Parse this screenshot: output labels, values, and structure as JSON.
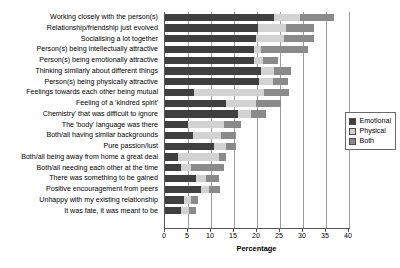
{
  "chart_data": {
    "type": "bar",
    "orientation": "horizontal",
    "stacked": true,
    "title": "",
    "xlabel": "Percentage",
    "ylabel": "",
    "xlim": [
      0,
      40
    ],
    "xticks": [
      0,
      5,
      10,
      15,
      20,
      25,
      30,
      35,
      40
    ],
    "grid": true,
    "legend_position": "right",
    "legend": [
      "Emotional",
      "Physical",
      "Both"
    ],
    "colors": {
      "Emotional": "#3f3f3f",
      "Physical": "#d2d2d2",
      "Both": "#8a8a8a"
    },
    "categories": [
      "Working closely with the person(s)",
      "Relationship/friendship just evolved",
      "Socialising a lot together",
      "Person(s) being intellectually attractive",
      "Person(s) being emotionally attractive",
      "Thinking similarly about different things",
      "Person(s) being physically attractive",
      "Feelings towards each other being mutual",
      "Feeling of a 'kindred spirit'",
      "Chemistry' that was difficult to ignore",
      "The 'body' language was there",
      "Both/all having similar backgrounds",
      "Pure passion/lust",
      "Both/all being away from home a great deal",
      "Both/all needing each other at the time",
      "There was something to be gained",
      "Positive encouragement from peers",
      "Unhappy with my existing relationship",
      "It was fate, it was meant to be"
    ],
    "series": [
      {
        "name": "Emotional",
        "values": [
          23.7,
          20.2,
          19.8,
          19.4,
          19.4,
          20.9,
          20.4,
          6.3,
          13.3,
          15.8,
          4.9,
          6.0,
          10.7,
          2.8,
          3.5,
          6.7,
          7.8,
          4.2,
          3.5
        ]
      },
      {
        "name": "Physical",
        "values": [
          5.6,
          6.1,
          6.1,
          1.5,
          1.9,
          2.8,
          3.0,
          15.2,
          6.5,
          2.9,
          8.0,
          6.2,
          2.6,
          9.0,
          2.2,
          2.2,
          1.8,
          1.5,
          1.8
        ]
      },
      {
        "name": "Both",
        "values": [
          7.4,
          6.1,
          6.5,
          10.1,
          3.3,
          3.7,
          3.3,
          5.5,
          5.4,
          3.3,
          3.6,
          3.2,
          2.1,
          1.5,
          7.2,
          2.9,
          2.4,
          1.5,
          1.4
        ]
      }
    ],
    "totals": [
      36.7,
      32.4,
      32.4,
      31.0,
      24.6,
      27.4,
      26.7,
      27.0,
      25.2,
      22.0,
      16.5,
      15.4,
      15.4,
      13.3,
      12.9,
      11.8,
      11.8,
      7.2,
      6.7
    ]
  }
}
